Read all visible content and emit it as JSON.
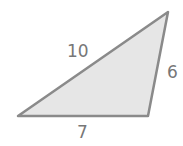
{
  "diagram": {
    "type": "triangle",
    "fill_color": "#e6e6e6",
    "stroke_color": "#8a8a8a",
    "label_color": "#777777",
    "sides": [
      {
        "name": "hypotenuse-left",
        "label": "10"
      },
      {
        "name": "right-side",
        "label": "6"
      },
      {
        "name": "bottom-side",
        "label": "7"
      }
    ]
  }
}
